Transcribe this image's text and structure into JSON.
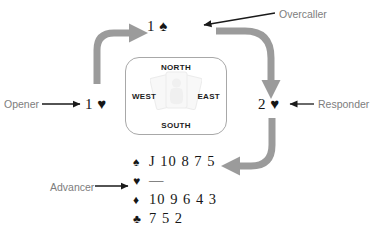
{
  "diagram": {
    "bids": {
      "overcall": {
        "level": "1",
        "suit": "♠",
        "text": "1 ♠"
      },
      "opener": {
        "level": "1",
        "suit": "♥",
        "text": "1 ♥"
      },
      "responder": {
        "level": "2",
        "suit": "♥",
        "text": "2 ♥"
      }
    },
    "labels": {
      "overcaller": "Overcaller",
      "opener": "Opener",
      "responder": "Responder",
      "advancer": "Advancer"
    },
    "compass": {
      "north": "NORTH",
      "south": "SOUTH",
      "west": "WEST",
      "east": "EAST"
    },
    "hand": [
      {
        "suit": "♠",
        "suit_name": "spades",
        "ranks": "J 10 8 7 5"
      },
      {
        "suit": "♥",
        "suit_name": "hearts",
        "ranks": "—"
      },
      {
        "suit": "♦",
        "suit_name": "diamonds",
        "ranks": "10 9 6 4 3"
      },
      {
        "suit": "♣",
        "suit_name": "clubs",
        "ranks": "7 5 2"
      }
    ],
    "colors": {
      "flow_arrow": "#9b9b9b",
      "pointer_arrow": "#1a1a1a",
      "label_text": "#7d7d7d",
      "bid_text": "#161616",
      "compass_border": "#a8a8a8",
      "background": "#ffffff"
    }
  }
}
